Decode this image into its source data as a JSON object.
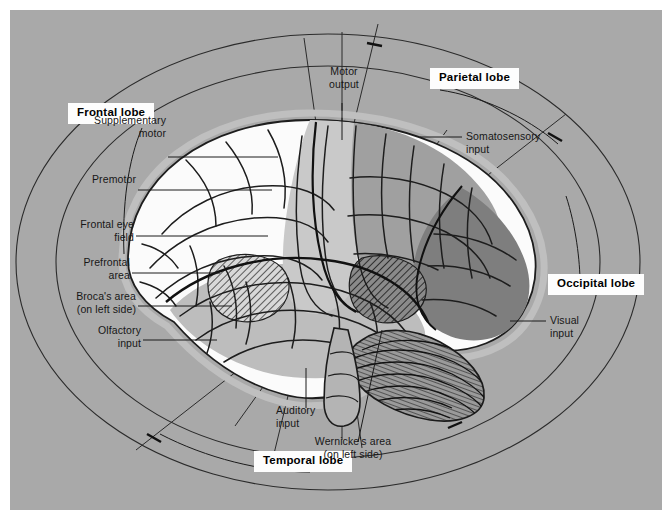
{
  "figure": {
    "background_color": "#a9a9a9",
    "page_color": "#ffffff"
  },
  "lobes": [
    {
      "id": "frontal",
      "label": "Frontal lobe",
      "shade": "#fbfbfb"
    },
    {
      "id": "parietal",
      "label": "Parietal lobe",
      "shade": "#a0a0a0"
    },
    {
      "id": "occipital",
      "label": "Occipital lobe",
      "shade": "#7e7e7e"
    },
    {
      "id": "temporal",
      "label": "Temporal lobe",
      "shade": "#bdbdbd"
    }
  ],
  "annotations": {
    "supplementary_motor": "Supplementary\nmotor",
    "supplementary_motor_l1": "Supplementary",
    "supplementary_motor_l2": "motor",
    "premotor": "Premotor",
    "frontal_eye_field_l1": "Frontal eye",
    "frontal_eye_field_l2": "field",
    "prefrontal_area_l1": "Prefrontal",
    "prefrontal_area_l2": "area",
    "brocas_area_l1": "Broca's area",
    "brocas_area_l2": "(on left side)",
    "olfactory_input_l1": "Olfactory",
    "olfactory_input_l2": "input",
    "motor_output_l1": "Motor",
    "motor_output_l2": "output",
    "somatosensory_input_l1": "Somatosensory",
    "somatosensory_input_l2": "input",
    "visual_input_l1": "Visual",
    "visual_input_l2": "input",
    "auditory_input_l1": "Auditory",
    "auditory_input_l2": "input",
    "wernickes_area_l1": "Wernicke's area",
    "wernickes_area_l2": "(on left side)"
  },
  "colors": {
    "ink": "#171717",
    "line": "#2b2b2b",
    "frontal_fill": "#fbfbfb",
    "precentral_fill": "#c9c9c9",
    "parietal_fill": "#a0a0a0",
    "occipital_fill": "#7e7e7e",
    "temporal_fill": "#bdbdbd",
    "cerebellum_fill": "#9a9a9a",
    "brainstem_fill": "#b4b4b4",
    "halo": "#bfbfbf"
  }
}
